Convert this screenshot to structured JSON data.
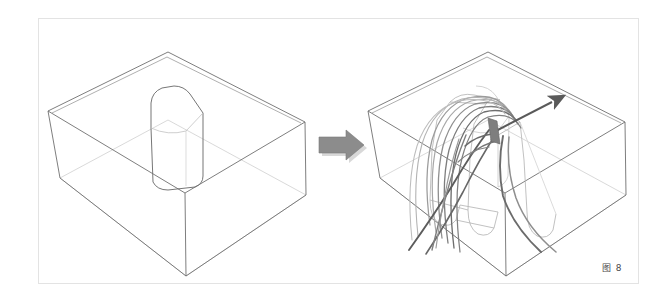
{
  "figure": {
    "caption": "图 8",
    "caption_label": "figure-8-caption",
    "background_color": "#ffffff",
    "frame_color": "#e3e3e3",
    "line_color": "#6f6f6f",
    "faint_line_color": "#c9c9c9",
    "streamline_dark_color": "#555555",
    "streamline_mid_color": "#888888",
    "streamline_light_color": "#b0b0b0",
    "transition_arrow_color": "#8c8c8c",
    "transition_arrow_shadow": "#d8d8d8",
    "direction_arrow_color": "#5a5a5a"
  },
  "panels": [
    {
      "id": "left-panel",
      "name": "initial-geometry-panel",
      "description": "Open rectangular 3D box containing an upright rounded pillar",
      "box": {
        "name": "wireframe-box",
        "top_back": [
          168,
          52
        ],
        "top_left": [
          48,
          111
        ],
        "top_right": [
          305,
          122
        ],
        "top_front": [
          185,
          193
        ],
        "bottom_left": [
          60,
          178
        ],
        "bottom_front": [
          186,
          276
        ],
        "bottom_right": [
          306,
          195
        ],
        "bottom_back": [
          168,
          120
        ]
      },
      "pillar": {
        "name": "rounded-pillar-obstacle",
        "top_apex": [
          172,
          88
        ],
        "base_front": [
          178,
          186
        ],
        "width": 54,
        "height": 100
      }
    },
    {
      "id": "right-panel",
      "name": "deformed-geometry-panel",
      "description": "Same box with extruded channel, streamline bundle and direction arrow",
      "box": {
        "name": "wireframe-box",
        "top_back": [
          488,
          52
        ],
        "top_left": [
          368,
          111
        ],
        "top_right": [
          625,
          122
        ],
        "top_front": [
          505,
          193
        ],
        "bottom_left": [
          380,
          178
        ],
        "bottom_front": [
          506,
          276
        ],
        "bottom_right": [
          626,
          195
        ],
        "bottom_back": [
          488,
          120
        ]
      },
      "streamlines": {
        "name": "streamline-bundle",
        "count": 12,
        "description": "Nested curved flow lines arcing over the deformed pillar and descending through twin channels"
      },
      "direction_arrow": {
        "name": "flow-direction-arrow",
        "tail": [
          498,
          131
        ],
        "head": [
          560,
          98
        ]
      },
      "channels": {
        "name": "extruded-channel-troughs",
        "count": 2,
        "description": "Two U-section troughs extending below the box floor"
      }
    }
  ],
  "transition_arrow": {
    "name": "transition-arrow",
    "direction": "right",
    "x": 318,
    "y": 131,
    "width": 46,
    "height": 30
  }
}
